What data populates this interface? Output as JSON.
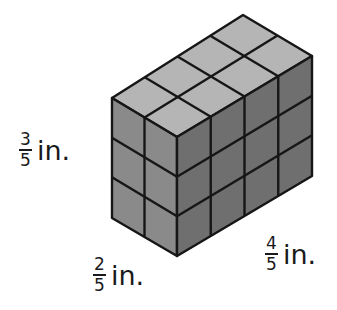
{
  "figure": {
    "cube_counts": {
      "width": 2,
      "length": 4,
      "height": 3
    },
    "colors": {
      "top": "#b5b5b5",
      "left": "#8a8a8a",
      "right": "#6f6f6f",
      "edge": "#161616"
    }
  },
  "labels": {
    "height": {
      "numerator": "3",
      "denominator": "5",
      "unit": "in."
    },
    "width": {
      "numerator": "2",
      "denominator": "5",
      "unit": "in."
    },
    "length": {
      "numerator": "4",
      "denominator": "5",
      "unit": "in."
    }
  }
}
